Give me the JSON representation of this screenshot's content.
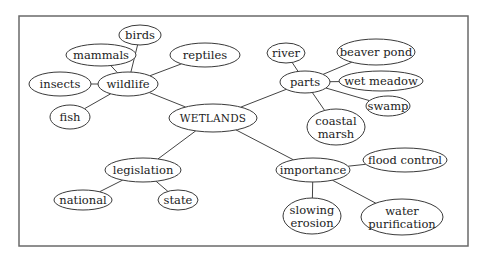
{
  "diagram": {
    "type": "concept-map",
    "frame": {
      "x": 19,
      "y": 16,
      "w": 449,
      "h": 230
    },
    "nodes": [
      {
        "id": "wetlands",
        "lines": [
          "WETLANDS"
        ],
        "cx": 213,
        "cy": 118,
        "rx": 44,
        "ry": 14,
        "center": true
      },
      {
        "id": "wildlife",
        "lines": [
          "wildlife"
        ],
        "cx": 128,
        "cy": 84,
        "rx": 30,
        "ry": 12
      },
      {
        "id": "birds",
        "lines": [
          "birds"
        ],
        "cx": 140,
        "cy": 35,
        "rx": 21,
        "ry": 10
      },
      {
        "id": "mammals",
        "lines": [
          "mammals"
        ],
        "cx": 101,
        "cy": 55,
        "rx": 35,
        "ry": 11
      },
      {
        "id": "reptiles",
        "lines": [
          "reptiles"
        ],
        "cx": 205,
        "cy": 55,
        "rx": 35,
        "ry": 12
      },
      {
        "id": "insects",
        "lines": [
          "insects"
        ],
        "cx": 60,
        "cy": 84,
        "rx": 31,
        "ry": 12
      },
      {
        "id": "fish",
        "lines": [
          "fish"
        ],
        "cx": 70,
        "cy": 117,
        "rx": 20,
        "ry": 12
      },
      {
        "id": "parts",
        "lines": [
          "parts"
        ],
        "cx": 305,
        "cy": 82,
        "rx": 25,
        "ry": 11
      },
      {
        "id": "river",
        "lines": [
          "river"
        ],
        "cx": 286,
        "cy": 53,
        "rx": 19,
        "ry": 10
      },
      {
        "id": "beaver-pond",
        "lines": [
          "beaver pond"
        ],
        "cx": 376,
        "cy": 52,
        "rx": 39,
        "ry": 13
      },
      {
        "id": "wet-meadow",
        "lines": [
          "wet meadow"
        ],
        "cx": 381,
        "cy": 81,
        "rx": 42,
        "ry": 10
      },
      {
        "id": "swamp",
        "lines": [
          "swamp"
        ],
        "cx": 388,
        "cy": 106,
        "rx": 22,
        "ry": 10
      },
      {
        "id": "coastal-marsh",
        "lines": [
          "coastal",
          "marsh"
        ],
        "cx": 336,
        "cy": 127,
        "rx": 29,
        "ry": 18
      },
      {
        "id": "legislation",
        "lines": [
          "legislation"
        ],
        "cx": 143,
        "cy": 170,
        "rx": 38,
        "ry": 12
      },
      {
        "id": "national",
        "lines": [
          "national"
        ],
        "cx": 83,
        "cy": 200,
        "rx": 29,
        "ry": 10
      },
      {
        "id": "state",
        "lines": [
          "state"
        ],
        "cx": 178,
        "cy": 200,
        "rx": 20,
        "ry": 10
      },
      {
        "id": "importance",
        "lines": [
          "importance"
        ],
        "cx": 313,
        "cy": 170,
        "rx": 37,
        "ry": 12
      },
      {
        "id": "flood-control",
        "lines": [
          "flood control"
        ],
        "cx": 405,
        "cy": 160,
        "rx": 42,
        "ry": 12
      },
      {
        "id": "slowing-erosion",
        "lines": [
          "slowing",
          "erosion"
        ],
        "cx": 312,
        "cy": 216,
        "rx": 29,
        "ry": 18
      },
      {
        "id": "water-purification",
        "lines": [
          "water",
          "purification"
        ],
        "cx": 402,
        "cy": 217,
        "rx": 41,
        "ry": 18
      }
    ],
    "edges": [
      {
        "from": "wetlands",
        "to": "wildlife"
      },
      {
        "from": "wetlands",
        "to": "parts"
      },
      {
        "from": "wetlands",
        "to": "legislation"
      },
      {
        "from": "wetlands",
        "to": "importance"
      },
      {
        "from": "wildlife",
        "to": "birds"
      },
      {
        "from": "wildlife",
        "to": "mammals"
      },
      {
        "from": "wildlife",
        "to": "reptiles"
      },
      {
        "from": "wildlife",
        "to": "insects"
      },
      {
        "from": "wildlife",
        "to": "fish"
      },
      {
        "from": "parts",
        "to": "river"
      },
      {
        "from": "parts",
        "to": "beaver-pond"
      },
      {
        "from": "parts",
        "to": "wet-meadow"
      },
      {
        "from": "parts",
        "to": "swamp"
      },
      {
        "from": "parts",
        "to": "coastal-marsh"
      },
      {
        "from": "legislation",
        "to": "national"
      },
      {
        "from": "legislation",
        "to": "state"
      },
      {
        "from": "importance",
        "to": "flood-control"
      },
      {
        "from": "importance",
        "to": "slowing-erosion"
      },
      {
        "from": "importance",
        "to": "water-purification"
      }
    ]
  }
}
